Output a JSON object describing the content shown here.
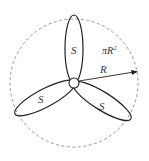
{
  "diagram": {
    "circle": {
      "cx": 74,
      "cy": 83,
      "r": 64,
      "style": "dashed",
      "color": "#777777"
    },
    "hub": {
      "cx": 74,
      "cy": 83,
      "r": 5
    },
    "lobe_label": "S",
    "labels": {
      "lobe_top": "S",
      "lobe_left": "S",
      "lobe_right": "S",
      "area": "πR",
      "area_exp": "2",
      "radius": "R"
    },
    "stroke_color": "#222222"
  }
}
